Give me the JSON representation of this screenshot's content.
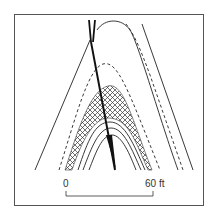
{
  "figure": {
    "type": "geological cross-section of an anticlinal fold cut by a fault",
    "stroke_color": "#222222",
    "frame_color": "#555555",
    "hatch_color": "#333333"
  },
  "scale_bar": {
    "start_label": "0",
    "end_label": "60 ft"
  },
  "legend": {
    "hatched_layer": "crosshatched bed",
    "dashed_lines": "dashed bed boundaries",
    "thick_line": "fault"
  }
}
